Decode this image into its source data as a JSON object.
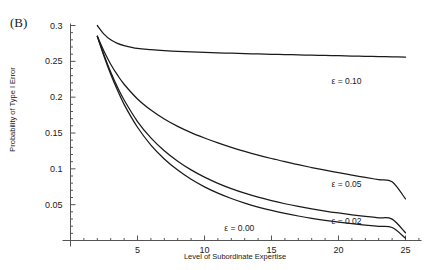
{
  "figure": {
    "panel_label": "(B)",
    "background_color": "#ffffff",
    "line_color": "#1a1a1a",
    "axis_color": "#555555"
  },
  "chart_data": {
    "type": "line",
    "title": "",
    "subtitle": "",
    "panel": "(B)",
    "xlabel": "Level of Subordinate Expertise",
    "ylabel": "Probability of Type I Error",
    "xlim": [
      0,
      26.2
    ],
    "ylim": [
      0,
      0.307
    ],
    "grid": false,
    "legend_position": "inline-right",
    "x_ticks": [
      5,
      10,
      15,
      20,
      25
    ],
    "x_tick_labels": [
      "5",
      "10",
      "15",
      "20",
      "25"
    ],
    "x_minor_tick_step": 1,
    "y_ticks": [
      0.05,
      0.1,
      0.15,
      0.2,
      0.25,
      0.3
    ],
    "y_tick_labels": [
      "0.05",
      "0.1",
      "0.15",
      "0.2",
      "0.25",
      "0.3"
    ],
    "y_minor_tick_step": 0.01,
    "x": [
      2,
      2.5,
      3,
      3.5,
      4,
      5,
      6,
      7,
      8,
      9,
      10,
      11,
      12,
      13,
      14,
      15,
      16,
      17,
      18,
      19,
      20,
      21,
      22,
      23,
      24,
      25
    ],
    "series": [
      {
        "name": "ε = 0.10",
        "label": "ε = 0.10",
        "epsilon": 0.1,
        "label_x": 20.6,
        "label_y": 0.222,
        "values": [
          0.3,
          0.288,
          0.28,
          0.275,
          0.272,
          0.268,
          0.2663,
          0.265,
          0.264,
          0.2632,
          0.2625,
          0.2619,
          0.2613,
          0.2608,
          0.2603,
          0.2598,
          0.2594,
          0.259,
          0.2586,
          0.2582,
          0.2578,
          0.2574,
          0.257,
          0.2566,
          0.2562,
          0.2558
        ]
      },
      {
        "name": "ε = 0.05",
        "label": "ε = 0.05",
        "epsilon": 0.05,
        "label_x": 20.6,
        "label_y": 0.0795,
        "values": [
          0.285,
          0.264,
          0.246,
          0.231,
          0.218,
          0.1975,
          0.182,
          0.1695,
          0.1592,
          0.1505,
          0.143,
          0.1362,
          0.13,
          0.1244,
          0.1192,
          0.1144,
          0.11,
          0.1058,
          0.1018,
          0.0981,
          0.0946,
          0.0912,
          0.088,
          0.0849,
          0.082,
          0.058
        ]
      },
      {
        "name": "ε = 0.02",
        "label": "ε = 0.02",
        "epsilon": 0.02,
        "label_x": 20.6,
        "label_y": 0.0278,
        "values": [
          0.285,
          0.259,
          0.235,
          0.214,
          0.196,
          0.166,
          0.1432,
          0.1252,
          0.1106,
          0.0985,
          0.0884,
          0.0798,
          0.0724,
          0.066,
          0.0604,
          0.0556,
          0.0513,
          0.0475,
          0.0441,
          0.0411,
          0.0384,
          0.0359,
          0.0337,
          0.0317,
          0.0298,
          0.0108
        ]
      },
      {
        "name": "ε = 0.00",
        "label": "ε = 0.00",
        "epsilon": 0.0,
        "label_x": 12.6,
        "label_y": 0.0175,
        "values": [
          0.285,
          0.257,
          0.232,
          0.21,
          0.19,
          0.158,
          0.1332,
          0.1138,
          0.0982,
          0.0854,
          0.0749,
          0.0661,
          0.0586,
          0.0522,
          0.0467,
          0.0419,
          0.0378,
          0.0342,
          0.031,
          0.0282,
          0.0257,
          0.0235,
          0.0215,
          0.0197,
          0.0181,
          0.0032
        ]
      }
    ]
  }
}
